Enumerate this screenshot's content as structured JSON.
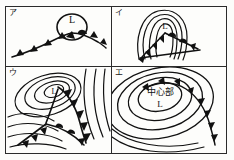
{
  "figure": {
    "title": "",
    "type": "weather-map-diagram-grid",
    "rows": 2,
    "columns": 2,
    "border_color": "#2b2b2b",
    "background_color": "#fdfdfb",
    "ink_color": "#111111"
  },
  "panels": [
    {
      "id": "a",
      "label": "ア",
      "low_label": "L",
      "center_label": "",
      "description": "front line with cold-front triangles and warm-front bumps, circled low center labelled L at the apex",
      "has_isobars": false,
      "front_symbols": [
        "cold-front-triangles",
        "warm-front-semicircles"
      ]
    },
    {
      "id": "i",
      "label": "イ",
      "low_label": "L",
      "center_label": "",
      "description": "narrow elongated isobars around L with cold front and warm front wedge beneath",
      "has_isobars": true,
      "front_symbols": [
        "cold-front-triangles",
        "warm-front-semicircles"
      ]
    },
    {
      "id": "u",
      "label": "ウ",
      "low_label": "L",
      "center_label": "",
      "description": "concentric elliptical isobars around L, occluded front trailing south-east with triangles and cold front to south-west",
      "has_isobars": true,
      "front_symbols": [
        "cold-front-triangles",
        "warm-front-semicircles"
      ]
    },
    {
      "id": "e",
      "label": "エ",
      "low_label": "L",
      "center_label": "中心部",
      "description": "concentric elliptical isobars with labelled central region, fronts along the right flank",
      "has_isobars": true,
      "front_symbols": [
        "cold-front-triangles",
        "warm-front-semicircles"
      ]
    }
  ]
}
